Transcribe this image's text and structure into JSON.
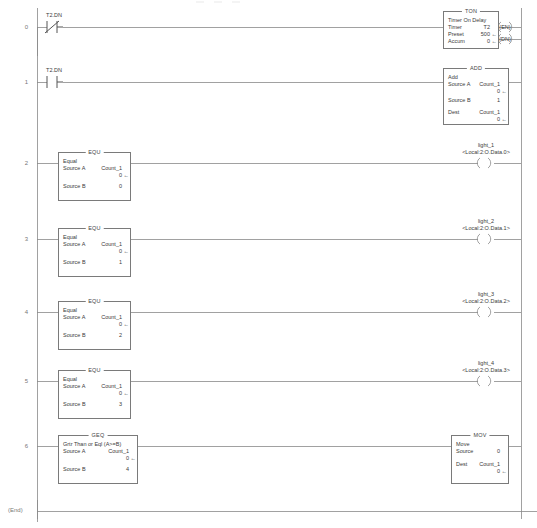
{
  "editor": {
    "end_label": "(End)",
    "line_color": "#8a8a8a",
    "box_border_color": "#7a7a7a",
    "text_color": "#3a3a3a",
    "rung_number_color": "#777777",
    "background": "#ffffff"
  },
  "rungs": [
    {
      "number": "0",
      "contacts": [
        {
          "tag": "T2.DN",
          "type": "xio-contact"
        }
      ],
      "blocks": [
        {
          "title": "TON",
          "mnemonic": "Timer On Delay",
          "params": [
            {
              "label": "Timer",
              "operand": "T2",
              "value": ""
            },
            {
              "label": "Preset",
              "operand": "",
              "value": "500",
              "arrow": true
            },
            {
              "label": "Accum",
              "operand": "",
              "value": "0",
              "arrow": true
            }
          ]
        }
      ],
      "coils": [
        {
          "inline": "(EN)",
          "tag": "",
          "address": ""
        },
        {
          "inline": "(DN)",
          "tag": "",
          "address": ""
        }
      ]
    },
    {
      "number": "1",
      "contacts": [
        {
          "tag": "T2.DN",
          "type": "xic-contact"
        }
      ],
      "blocks": [
        {
          "title": "ADD",
          "mnemonic": "Add",
          "params": [
            {
              "label": "Source A",
              "operand": "Count_1",
              "value": "0",
              "arrow": true
            },
            {
              "label": "Source B",
              "operand": "",
              "value": "1"
            },
            {
              "label": "Dest",
              "operand": "Count_1",
              "value": "0",
              "arrow": true
            }
          ]
        }
      ],
      "coils": []
    },
    {
      "number": "2",
      "contacts": [],
      "blocks": [
        {
          "title": "EQU",
          "mnemonic": "Equal",
          "params": [
            {
              "label": "Source A",
              "operand": "Count_1",
              "value": "0",
              "arrow": true
            },
            {
              "label": "Source B",
              "operand": "",
              "value": "0"
            }
          ]
        }
      ],
      "coils": [
        {
          "inline": "",
          "tag": "light_1",
          "address": "<Local:2:O.Data.0>"
        }
      ]
    },
    {
      "number": "3",
      "contacts": [],
      "blocks": [
        {
          "title": "EQU",
          "mnemonic": "Equal",
          "params": [
            {
              "label": "Source A",
              "operand": "Count_1",
              "value": "0",
              "arrow": true
            },
            {
              "label": "Source B",
              "operand": "",
              "value": "1"
            }
          ]
        }
      ],
      "coils": [
        {
          "inline": "",
          "tag": "light_2",
          "address": "<Local:2:O.Data.1>"
        }
      ]
    },
    {
      "number": "4",
      "contacts": [],
      "blocks": [
        {
          "title": "EQU",
          "mnemonic": "Equal",
          "params": [
            {
              "label": "Source A",
              "operand": "Count_1",
              "value": "0",
              "arrow": true
            },
            {
              "label": "Source B",
              "operand": "",
              "value": "2"
            }
          ]
        }
      ],
      "coils": [
        {
          "inline": "",
          "tag": "light_3",
          "address": "<Local:2:O.Data.2>"
        }
      ]
    },
    {
      "number": "5",
      "contacts": [],
      "blocks": [
        {
          "title": "EQU",
          "mnemonic": "Equal",
          "params": [
            {
              "label": "Source A",
              "operand": "Count_1",
              "value": "0",
              "arrow": true
            },
            {
              "label": "Source B",
              "operand": "",
              "value": "3"
            }
          ]
        }
      ],
      "coils": [
        {
          "inline": "",
          "tag": "light_4",
          "address": "<Local:2:O.Data.3>"
        }
      ]
    },
    {
      "number": "6",
      "contacts": [],
      "blocks": [
        {
          "title": "GEQ",
          "mnemonic": "Grtr Than or Eql (A>=B)",
          "params": [
            {
              "label": "Source A",
              "operand": "Count_1",
              "value": "0",
              "arrow": true
            },
            {
              "label": "Source B",
              "operand": "",
              "value": "4"
            }
          ]
        },
        {
          "title": "MOV",
          "mnemonic": "Move",
          "params": [
            {
              "label": "Source",
              "operand": "",
              "value": "0"
            },
            {
              "label": "Dest",
              "operand": "Count_1",
              "value": "0",
              "arrow": true
            }
          ]
        }
      ],
      "coils": []
    }
  ]
}
